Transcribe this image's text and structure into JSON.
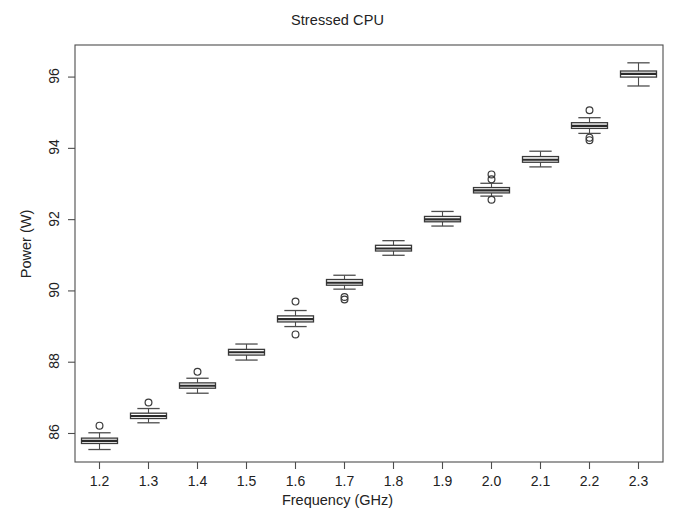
{
  "chart_data": {
    "type": "boxplot",
    "title": "Stressed CPU",
    "xlabel": "Frequency (GHz)",
    "ylabel": "Power (W)",
    "grid": false,
    "legend": "none",
    "xlim": [
      1.15,
      2.35
    ],
    "ylim": [
      85.2,
      96.9
    ],
    "yticks": [
      86,
      88,
      90,
      92,
      94,
      96
    ],
    "ytick_labels": [
      "86",
      "88",
      "90",
      "92",
      "94",
      "96"
    ],
    "categories": [
      "1.2",
      "1.3",
      "1.4",
      "1.5",
      "1.6",
      "1.7",
      "1.8",
      "1.9",
      "2.0",
      "2.1",
      "2.2",
      "2.3"
    ],
    "xtick_labels": [
      "1.2",
      "1.3",
      "1.4",
      "1.5",
      "1.6",
      "1.7",
      "1.8",
      "1.9",
      "2.0",
      "2.1",
      "2.2",
      "2.3"
    ],
    "boxes": [
      {
        "category": "1.2",
        "lower_whisker": 85.55,
        "q1": 85.72,
        "median": 85.79,
        "q3": 85.87,
        "upper_whisker": 86.02,
        "outliers": [
          86.22
        ]
      },
      {
        "category": "1.3",
        "lower_whisker": 86.3,
        "q1": 86.42,
        "median": 86.49,
        "q3": 86.57,
        "upper_whisker": 86.7,
        "outliers": [
          86.87
        ]
      },
      {
        "category": "1.4",
        "lower_whisker": 87.13,
        "q1": 87.27,
        "median": 87.34,
        "q3": 87.42,
        "upper_whisker": 87.55,
        "outliers": [
          87.73
        ]
      },
      {
        "category": "1.5",
        "lower_whisker": 88.06,
        "q1": 88.2,
        "median": 88.28,
        "q3": 88.36,
        "upper_whisker": 88.51,
        "outliers": []
      },
      {
        "category": "1.6",
        "lower_whisker": 89.0,
        "q1": 89.13,
        "median": 89.21,
        "q3": 89.3,
        "upper_whisker": 89.45,
        "outliers": [
          89.7,
          88.78
        ]
      },
      {
        "category": "1.7",
        "lower_whisker": 90.05,
        "q1": 90.16,
        "median": 90.23,
        "q3": 90.32,
        "upper_whisker": 90.44,
        "outliers": [
          89.83,
          89.76
        ]
      },
      {
        "category": "1.8",
        "lower_whisker": 91.0,
        "q1": 91.12,
        "median": 91.19,
        "q3": 91.28,
        "upper_whisker": 91.41,
        "outliers": []
      },
      {
        "category": "1.9",
        "lower_whisker": 91.82,
        "q1": 91.94,
        "median": 92.01,
        "q3": 92.09,
        "upper_whisker": 92.23,
        "outliers": []
      },
      {
        "category": "2.0",
        "lower_whisker": 92.66,
        "q1": 92.75,
        "median": 92.82,
        "q3": 92.9,
        "upper_whisker": 93.02,
        "outliers": [
          93.27,
          93.13,
          92.56
        ]
      },
      {
        "category": "2.1",
        "lower_whisker": 93.48,
        "q1": 93.61,
        "median": 93.68,
        "q3": 93.77,
        "upper_whisker": 93.92,
        "outliers": []
      },
      {
        "category": "2.2",
        "lower_whisker": 94.42,
        "q1": 94.56,
        "median": 94.63,
        "q3": 94.72,
        "upper_whisker": 94.86,
        "outliers": [
          95.07,
          94.3,
          94.23
        ]
      },
      {
        "category": "2.3",
        "lower_whisker": 95.75,
        "q1": 96.0,
        "median": 96.09,
        "q3": 96.17,
        "upper_whisker": 96.4,
        "outliers": []
      }
    ],
    "colors": {
      "axis": "#4d4d4d",
      "box_stroke": "#3a3a3a",
      "box_fill": "#ffffff",
      "median": "#2b2b2b",
      "whisker": "#4d4d4d",
      "outlier": "#3a3a3a",
      "background": "#ffffff"
    }
  }
}
